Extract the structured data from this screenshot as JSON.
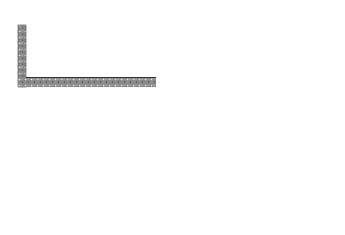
{
  "panels": [
    {
      "spring_label": "k",
      "spring_sub": "1",
      "spring_value": "= 10.0 N/m",
      "amplitude_label": "amplitude",
      "amplitude_value": "= 20 cm",
      "mass_label": "m",
      "mass_sub": "1",
      "origin_var": "x",
      "origin_value": "= 0"
    },
    {
      "spring_label": "k",
      "spring_sub": "2",
      "spring_value": "= 10.0 N/m",
      "amplitude_label": "amplitude",
      "amplitude_value": "= 10 cm",
      "mass_label": "m",
      "mass_sub": "2",
      "origin_var": "x",
      "origin_value": "= 0"
    }
  ],
  "colors": {
    "wall": "#7a7a7a",
    "spring": "#555555",
    "mass_fill": "#d8d8d8",
    "line": "#333333"
  }
}
